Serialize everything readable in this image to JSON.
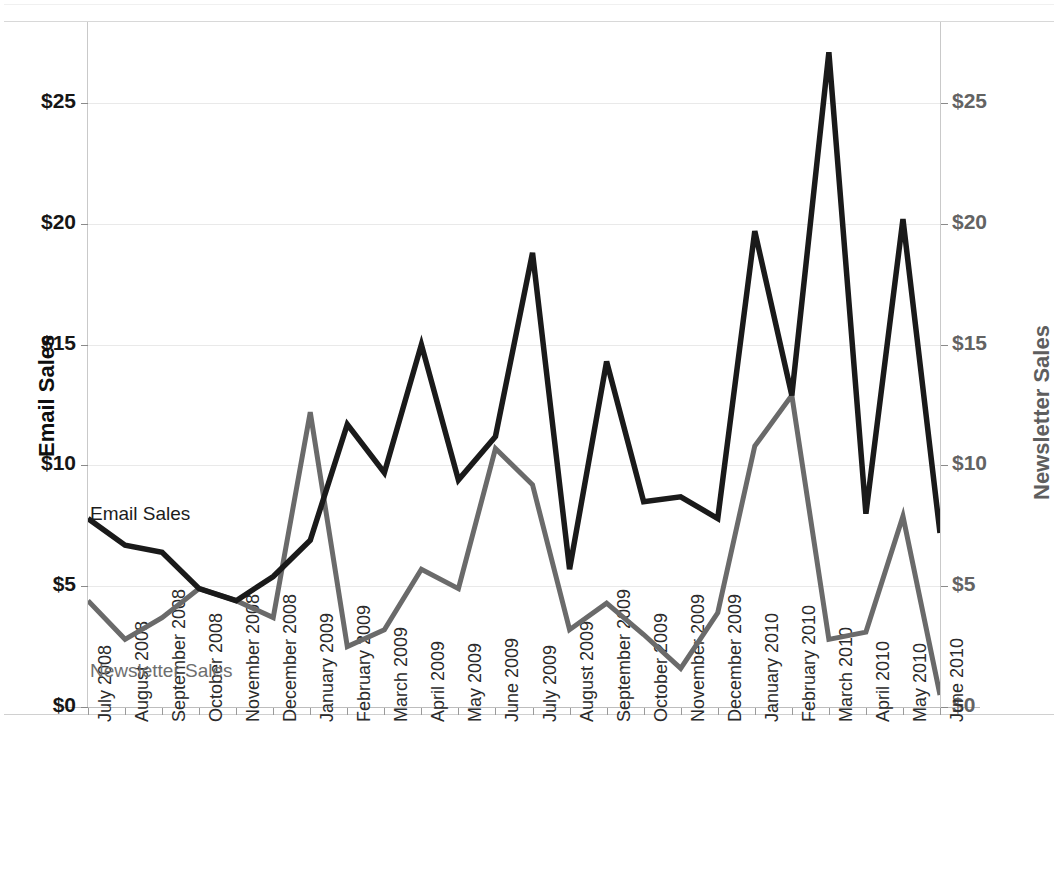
{
  "chart_data": {
    "type": "line",
    "title": "",
    "xlabel": "",
    "ylabel": "Email Sales",
    "y2label": "Newsletter Sales",
    "grid": true,
    "legend_position": "in-plot-annotations",
    "ylim": [
      0,
      28.5
    ],
    "y2lim": [
      0,
      28.5
    ],
    "yticks": [
      0,
      5,
      10,
      15,
      20,
      25
    ],
    "ytick_labels": [
      "$0",
      "$5",
      "$10",
      "$15",
      "$20",
      "$25"
    ],
    "y2ticks": [
      0,
      5,
      10,
      15,
      20,
      25
    ],
    "y2tick_labels": [
      "$0",
      "$5",
      "$10",
      "$15",
      "$20",
      "$25"
    ],
    "categories": [
      "July 2008",
      "August 2008",
      "September 2008",
      "October 2008",
      "November 2008",
      "December 2008",
      "January 2009",
      "February 2009",
      "March 2009",
      "April 2009",
      "May 2009",
      "June 2009",
      "July 2009",
      "August 2009",
      "September 2009",
      "October 2009",
      "November 2009",
      "December 2009",
      "January 2010",
      "February 2010",
      "March 2010",
      "April 2010",
      "May 2010",
      "June 2010"
    ],
    "series": [
      {
        "name": "Email Sales",
        "axis": "left",
        "color": "#1a1a1a",
        "values": [
          7.8,
          6.7,
          6.4,
          4.9,
          4.4,
          5.4,
          6.9,
          11.7,
          9.7,
          15.0,
          9.4,
          11.2,
          18.8,
          5.7,
          14.3,
          8.5,
          8.7,
          7.8,
          19.7,
          12.9,
          27.1,
          8.0,
          20.2,
          7.2
        ]
      },
      {
        "name": "Newsletter Sales",
        "axis": "right",
        "color": "#6a6a6a",
        "values": [
          4.4,
          2.8,
          3.7,
          4.9,
          4.4,
          3.7,
          12.2,
          2.5,
          3.2,
          5.7,
          4.9,
          10.7,
          9.2,
          3.2,
          4.3,
          3.0,
          1.6,
          3.9,
          10.8,
          12.9,
          2.8,
          3.1,
          7.9,
          0.5
        ]
      }
    ],
    "annotations": [
      {
        "text": "Email Sales",
        "color": "#1c1c1c"
      },
      {
        "text": "Newsletter Sales",
        "color": "#6e6e6e"
      }
    ]
  }
}
